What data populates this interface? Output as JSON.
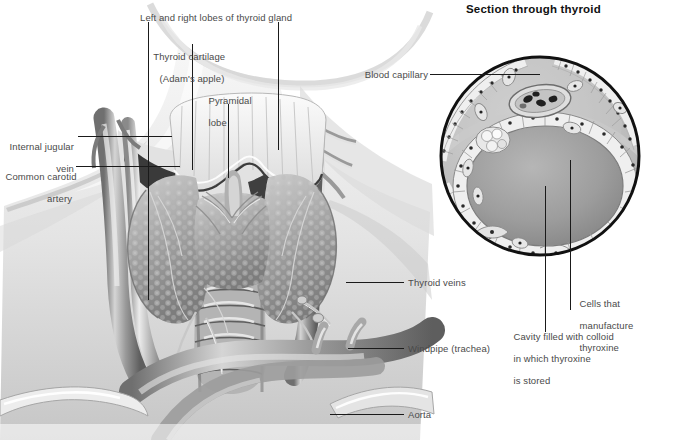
{
  "figure": {
    "kind": "anatomical-illustration",
    "background_color": "#ffffff",
    "label_color": "#4a4a4a",
    "leader_color": "#1a1a1a",
    "ink_dark": "#2b2b2b",
    "tissue_mid": "#9b9b9b",
    "tissue_light": "#d8d8d8"
  },
  "inset": {
    "title": "Section through thyroid",
    "shape": "circle",
    "center": [
      540,
      156
    ],
    "radius": 100,
    "outline_color": "#111111"
  },
  "labels": {
    "lobes": "Left and right lobes of thyroid gland",
    "cartilage_line1": "Thyroid cartilage",
    "cartilage_line2": "(Adam's apple)",
    "pyramidal_line1": "Pyramidal",
    "pyramidal_line2": "lobe",
    "jugular_line1": "Internal jugular",
    "jugular_line2": "vein",
    "carotid_line1": "Common carotid",
    "carotid_line2": "artery",
    "thyroid_veins": "Thyroid veins",
    "windpipe": "Windpipe (trachea)",
    "aorta": "Aorta",
    "blood_capillary": "Blood capillary",
    "cells_line1": "Cells that",
    "cells_line2": "manufacture",
    "cells_line3": "thyroxine",
    "cavity_line1": "Cavity filled with colloid",
    "cavity_line2": "in which thyroxine",
    "cavity_line3": "is stored"
  },
  "structures": [
    {
      "name": "thyroid-gland",
      "description": "bilobed granular gland astride the trachea"
    },
    {
      "name": "thyroid-cartilage",
      "description": "Adam's apple shield above the gland"
    },
    {
      "name": "pyramidal-lobe",
      "description": "slender upward projection from the isthmus"
    },
    {
      "name": "trachea",
      "description": "ringed windpipe descending below the isthmus"
    },
    {
      "name": "aortic-arch",
      "description": "large curved vessel at the base of the neck"
    },
    {
      "name": "internal-jugular-vein",
      "description": "large vein lateral in the neck"
    },
    {
      "name": "common-carotid-artery",
      "description": "artery medial to the jugular vein"
    },
    {
      "name": "thyroid-veins",
      "description": "veins draining the gland"
    },
    {
      "name": "clavicle",
      "description": "collarbone at lower left and right"
    }
  ],
  "inset_structures": [
    {
      "name": "thyroid-follicle",
      "description": "central follicle ringed by cuboidal cells"
    },
    {
      "name": "colloid-cavity",
      "description": "grey colloid-filled lumen of the follicle"
    },
    {
      "name": "follicular-cells",
      "description": "pale cuboidal cells with dark nuclei"
    },
    {
      "name": "blood-capillary",
      "description": "vessel containing blood cells"
    },
    {
      "name": "parafollicular-cell-cluster",
      "description": "pale cell cluster beside follicle"
    },
    {
      "name": "connective-tissue",
      "description": "grey stroma between follicles"
    }
  ]
}
